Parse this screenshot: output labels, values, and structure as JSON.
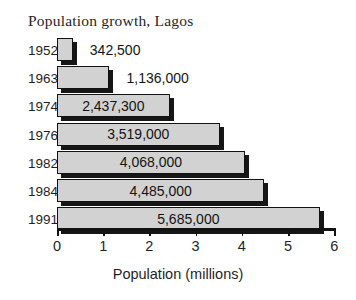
{
  "chart_data": {
    "type": "bar",
    "orientation": "horizontal",
    "title": "Population growth, Lagos",
    "xlabel": "Population (millions)",
    "ylabel": "",
    "categories": [
      "1952",
      "1963",
      "1974",
      "1976",
      "1982",
      "1984",
      "1991"
    ],
    "values": [
      0.3425,
      1.136,
      2.4373,
      3.519,
      4.068,
      4.485,
      5.685
    ],
    "data_labels": [
      "342,500",
      "1,136,000",
      "2,437,300",
      "3,519,000",
      "4,068,000",
      "4,485,000",
      "5,685,000"
    ],
    "label_placement": [
      "outside",
      "outside",
      "inside",
      "inside",
      "inside",
      "inside",
      "inside"
    ],
    "xlim": [
      0,
      6
    ],
    "xticks": [
      0,
      1,
      2,
      3,
      4,
      5,
      6
    ],
    "xtick_labels": [
      "0",
      "1",
      "2",
      "3",
      "4",
      "5",
      "6"
    ],
    "grid": false,
    "legend": false,
    "bar_fill_color": "#d2d2d2",
    "bar_edge_color": "#121212",
    "bar_shadow_color": "#161616",
    "background_color": "#ffffff",
    "text_color": "#1f1f1f"
  },
  "axis": {
    "label": "Population (millions)"
  },
  "title": {
    "text": "Population growth, Lagos"
  }
}
